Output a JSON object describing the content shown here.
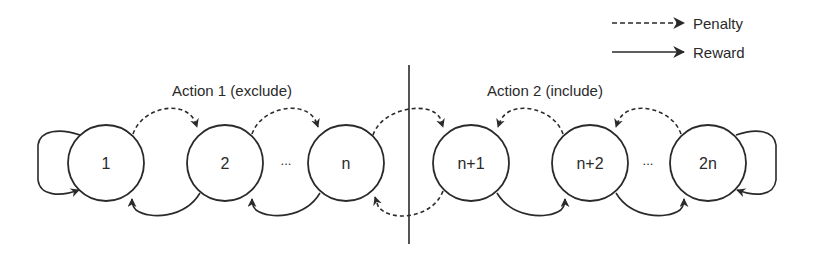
{
  "legend": {
    "penalty": {
      "label": "Penalty",
      "style": "dashed"
    },
    "reward": {
      "label": "Reward",
      "style": "solid"
    }
  },
  "sections": [
    {
      "id": "action1",
      "title": "Action 1 (exclude)"
    },
    {
      "id": "action2",
      "title": "Action 2 (include)"
    }
  ],
  "states": [
    {
      "id": "s1",
      "label": "1",
      "section": "action1"
    },
    {
      "id": "s2",
      "label": "2",
      "section": "action1"
    },
    {
      "id": "sn",
      "label": "n",
      "section": "action1"
    },
    {
      "id": "sn1",
      "label": "n+1",
      "section": "action2"
    },
    {
      "id": "sn2",
      "label": "n+2",
      "section": "action2"
    },
    {
      "id": "s2n",
      "label": "2n",
      "section": "action2"
    }
  ],
  "ellipsis": [
    "...",
    "..."
  ],
  "transitions": [
    {
      "from": "1",
      "to": "1",
      "type": "reward"
    },
    {
      "from": "1",
      "to": "2",
      "type": "penalty"
    },
    {
      "from": "2",
      "to": "n",
      "type": "penalty"
    },
    {
      "from": "2",
      "to": "1",
      "type": "reward"
    },
    {
      "from": "n",
      "to": "2",
      "type": "reward"
    },
    {
      "from": "n",
      "to": "n+1",
      "type": "penalty"
    },
    {
      "from": "n+1",
      "to": "n",
      "type": "penalty"
    },
    {
      "from": "n+2",
      "to": "n+1",
      "type": "penalty"
    },
    {
      "from": "2n",
      "to": "n+2",
      "type": "penalty"
    },
    {
      "from": "n+1",
      "to": "n+2",
      "type": "reward"
    },
    {
      "from": "n+2",
      "to": "2n",
      "type": "reward"
    },
    {
      "from": "2n",
      "to": "2n",
      "type": "reward"
    }
  ],
  "colors": {
    "stroke": "#2a2a2a",
    "background": "#ffffff"
  }
}
